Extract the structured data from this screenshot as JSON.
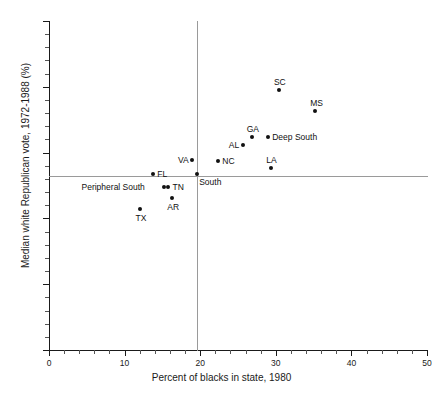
{
  "chart_data": {
    "type": "scatter",
    "title": "",
    "xlabel": "Percent of blacks in state, 1980",
    "ylabel": "Median white Republican vote, 1972-1988 (%)",
    "xlim": [
      0,
      50
    ],
    "ylim": [
      40,
      90
    ],
    "xticks": [
      0,
      10,
      20,
      30,
      40,
      50
    ],
    "yticks": [
      40,
      50,
      60,
      70,
      80,
      90
    ],
    "xtick_labels": [
      "0",
      "10",
      "20",
      "30",
      "40",
      "50"
    ],
    "ytick_labels": [
      "40",
      "50",
      "60",
      "70",
      "80",
      "90"
    ],
    "xtick_minor_step": 2,
    "ytick_minor_step": 2,
    "grid": false,
    "legend": "none",
    "reference_lines": [
      {
        "orientation": "horizontal",
        "value": 66.5,
        "label": "South median vote"
      },
      {
        "orientation": "vertical",
        "value": 19.6,
        "label": "South percent black"
      }
    ],
    "points": [
      {
        "label": "TX",
        "x": 12.1,
        "y": 61.4,
        "label_pos": "below"
      },
      {
        "label": "AR",
        "x": 16.3,
        "y": 63.1,
        "label_pos": "below"
      },
      {
        "label": "TN",
        "x": 15.8,
        "y": 64.8,
        "label_pos": "right"
      },
      {
        "label": "FL",
        "x": 13.8,
        "y": 66.8,
        "label_pos": "right"
      },
      {
        "label": "Peripheral South",
        "x": 15.2,
        "y": 64.8,
        "label_pos": "left"
      },
      {
        "label": "VA",
        "x": 18.9,
        "y": 68.9,
        "label_pos": "left"
      },
      {
        "label": "South",
        "x": 19.6,
        "y": 66.8,
        "label_pos": "below-right"
      },
      {
        "label": "NC",
        "x": 22.4,
        "y": 68.7,
        "label_pos": "right"
      },
      {
        "label": "AL",
        "x": 25.6,
        "y": 71.2,
        "label_pos": "left"
      },
      {
        "label": "GA",
        "x": 26.8,
        "y": 72.3,
        "label_pos": "above"
      },
      {
        "label": "LA",
        "x": 29.4,
        "y": 67.7,
        "label_pos": "above"
      },
      {
        "label": "Deep South",
        "x": 29.0,
        "y": 72.3,
        "label_pos": "right"
      },
      {
        "label": "SC",
        "x": 30.4,
        "y": 79.5,
        "label_pos": "above"
      },
      {
        "label": "MS",
        "x": 35.2,
        "y": 76.3,
        "label_pos": "above"
      }
    ]
  }
}
